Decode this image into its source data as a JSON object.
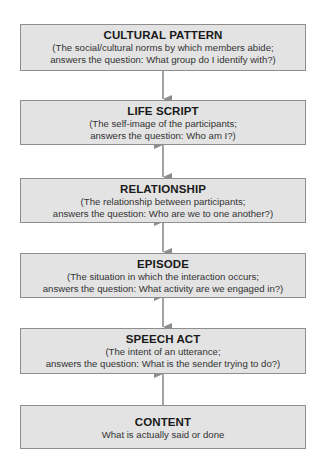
{
  "diagram": {
    "type": "hierarchy-flow",
    "colors": {
      "box_fill": "#e3e3e3",
      "box_border": "#8e8e8e",
      "arrow": "#8c8c8c",
      "title_text": "#1a1a1a",
      "desc_text": "#333333"
    },
    "levels": [
      {
        "title": "CULTURAL PATTERN",
        "line1": "(The social/cultural norms by which members abide;",
        "line2": "answers the question: What group do I identify with?)"
      },
      {
        "title": "LIFE SCRIPT",
        "line1": "(The self-image of the participants;",
        "line2": "answers the question: Who am I?)"
      },
      {
        "title": "RELATIONSHIP",
        "line1": "(The relationship between participants;",
        "line2": "answers the question: Who are we to one another?)"
      },
      {
        "title": "EPISODE",
        "line1": "(The situation in which the interaction occurs;",
        "line2": "answers the question: What activity are we engaged in?)"
      },
      {
        "title": "SPEECH ACT",
        "line1": "(The intent of an utterance;",
        "line2": "answers the question: What is the sender trying to do?)"
      },
      {
        "title": "CONTENT",
        "line1": "What is actually said or done",
        "line2": ""
      }
    ],
    "connectors": [
      {
        "from": "CULTURAL PATTERN",
        "to": "LIFE SCRIPT",
        "style": "arrow-down"
      },
      {
        "from": "LIFE SCRIPT",
        "to": "RELATIONSHIP",
        "style": "bidirectional"
      },
      {
        "from": "RELATIONSHIP",
        "to": "EPISODE",
        "style": "bidirectional"
      },
      {
        "from": "EPISODE",
        "to": "SPEECH ACT",
        "style": "bidirectional"
      },
      {
        "from": "CONTENT",
        "to": "SPEECH ACT",
        "style": "arrow-up"
      }
    ]
  }
}
